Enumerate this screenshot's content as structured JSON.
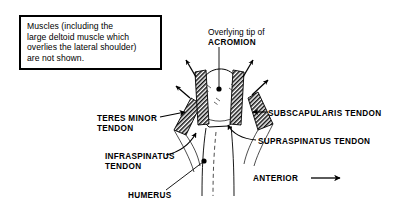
{
  "figure": {
    "background_color": "#ffffff",
    "ink_color": "#000000"
  },
  "note_box": {
    "name": "muscles-not-shown-note",
    "lines": [
      "Muscles (including the",
      "large deltoid muscle which",
      "overlies the lateral shoulder)",
      "are not shown."
    ]
  },
  "labels": {
    "acromion_prefix": "Overlying tip of",
    "acromion": "ACROMION",
    "teres_minor_line1": "TERES MINOR",
    "teres_minor_line2": "TENDON",
    "infraspinatus_line1": "INFRASPINATUS",
    "infraspinatus_line2": "TENDON",
    "subscapularis": "SUBSCAPULARIS TENDON",
    "supraspinatus": "SUPRASPINATUS TENDON",
    "humerus": "HUMERUS",
    "anterior": "ANTERIOR"
  },
  "diagram": {
    "structures": [
      "humeral-head",
      "humeral-shaft",
      "teres-minor-tendon-band",
      "infraspinatus-tendon-band",
      "supraspinatus-tendon-band",
      "subscapularis-tendon-band"
    ],
    "splay_arrow_count": 4,
    "leader_arrow_count": 3,
    "leader_dot_count": 2,
    "direction_arrow": "anterior-right-arrow"
  }
}
